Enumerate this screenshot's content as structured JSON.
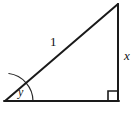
{
  "figure": {
    "type": "right-triangle-diagram",
    "background_color": "#ffffff",
    "stroke_color": "#1a1a1a",
    "stroke_width": 2,
    "width": 137,
    "height": 116,
    "vertices": {
      "bottom_left": {
        "x": 5,
        "y": 101
      },
      "top_right": {
        "x": 118,
        "y": 4
      },
      "bottom_right": {
        "x": 118,
        "y": 101
      }
    },
    "labels": {
      "hypotenuse": "1",
      "vertical_leg": "x",
      "angle": "y"
    },
    "markers": {
      "right_angle_square": {
        "size": 10,
        "corner": "bottom-right"
      },
      "angle_arc": {
        "at": "bottom-left",
        "radius": 28
      }
    }
  }
}
